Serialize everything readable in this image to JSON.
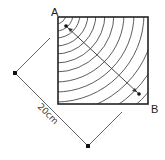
{
  "diagram": {
    "type": "wood-grain square with diagonal measurement",
    "labels": {
      "corner_a": "A",
      "corner_b": "B",
      "dimension": "20cm"
    },
    "colors": {
      "stroke": "#222222",
      "grain": "#333333",
      "dimension_line": "#555555",
      "background": "#ffffff"
    }
  }
}
